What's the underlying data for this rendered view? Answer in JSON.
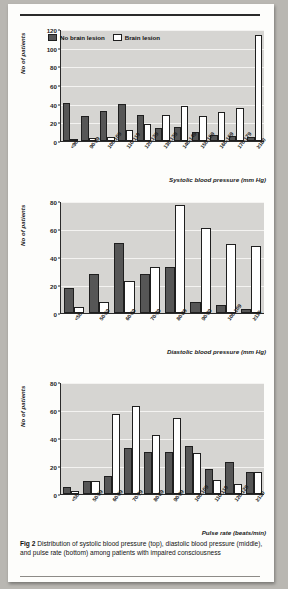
{
  "figure": {
    "caption_label": "Fig 2",
    "caption_text": "Distribution of systolic blood pressure (top), diastolic blood pressure (middle), and pulse rate (bottom) among patients with impaired consciousness",
    "legend": [
      {
        "key": "no_lesion",
        "label": "No brain lesion",
        "color": "#565656"
      },
      {
        "key": "lesion",
        "label": "Brain lesion",
        "color": "#ffffff"
      }
    ]
  },
  "chart_data": [
    {
      "id": "systolic",
      "type": "bar",
      "title": "",
      "xlabel": "Systolic blood pressure (mm Hg)",
      "ylabel": "No of patients",
      "ylim": [
        0,
        120
      ],
      "yticks": [
        0,
        20,
        40,
        60,
        80,
        100,
        120
      ],
      "grid": true,
      "legend_position": "top-left",
      "categories": [
        "<90",
        "90-99",
        "100-109",
        "110-119",
        "120-129",
        "130-139",
        "140-149",
        "150-159",
        "160-169",
        "170-179",
        "≥180"
      ],
      "series": [
        {
          "name": "No brain lesion",
          "values": [
            41,
            27,
            32,
            40,
            28,
            14,
            15,
            10,
            6,
            5,
            4
          ]
        },
        {
          "name": "Brain lesion",
          "values": [
            2,
            3,
            4,
            12,
            18,
            28,
            38,
            27,
            31,
            35,
            114
          ]
        }
      ]
    },
    {
      "id": "diastolic",
      "type": "bar",
      "title": "",
      "xlabel": "Diastolic blood pressure (mm Hg)",
      "ylabel": "No of patients",
      "ylim": [
        0,
        80
      ],
      "yticks": [
        0,
        20,
        40,
        60,
        80
      ],
      "grid": true,
      "legend_position": "none",
      "categories": [
        "<50",
        "50-59",
        "60-69",
        "70-79",
        "80-89",
        "90-99",
        "100-109",
        "≥110"
      ],
      "series": [
        {
          "name": "No brain lesion",
          "values": [
            18,
            28,
            50,
            28,
            33,
            8,
            6,
            3
          ]
        },
        {
          "name": "Brain lesion",
          "values": [
            4,
            8,
            23,
            33,
            77,
            61,
            49,
            48
          ]
        }
      ]
    },
    {
      "id": "pulse",
      "type": "bar",
      "title": "",
      "xlabel": "Pulse rate (beats/min)",
      "ylabel": "No of patients",
      "ylim": [
        0,
        80
      ],
      "yticks": [
        0,
        20,
        40,
        60,
        80
      ],
      "grid": true,
      "legend_position": "none",
      "categories": [
        "<50",
        "50-59",
        "60-69",
        "70-79",
        "80-89",
        "90-99",
        "100-109",
        "110-119",
        "120-129",
        "≥130"
      ],
      "series": [
        {
          "name": "No brain lesion",
          "values": [
            5,
            9,
            13,
            33,
            30,
            30,
            34,
            18,
            23,
            16
          ]
        },
        {
          "name": "Brain lesion",
          "values": [
            2,
            9,
            57,
            63,
            42,
            54,
            29,
            10,
            7,
            16
          ]
        }
      ]
    }
  ]
}
